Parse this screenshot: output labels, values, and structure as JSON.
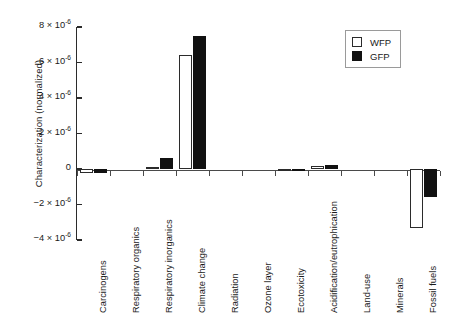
{
  "chart_data": {
    "type": "bar",
    "title": "",
    "xlabel": "",
    "ylabel": "Characterization (normalized)",
    "ylim": [
      -4e-06,
      8e-06
    ],
    "ytick_values": [
      8e-06,
      6e-06,
      4e-06,
      2e-06,
      0,
      -2e-06,
      -4e-06
    ],
    "ytick_labels": [
      "8 × 10",
      "6 × 10",
      "4 × 10",
      "2 × 10",
      "0",
      "−2 × 10",
      "−4 × 10"
    ],
    "ytick_exponents": [
      "-6",
      "-6",
      "-6",
      "-6",
      "",
      "-6",
      "-6"
    ],
    "grid": false,
    "legend_position": "top-right",
    "categories": [
      "Carcinogens",
      "Respiratory organics",
      "Respiratory inorganics",
      "Climate change",
      "Radiation",
      "Ozone layer",
      "Ecotoxicity",
      "Acidification/eutrophication",
      "Land-use",
      "Minerals",
      "Fossil fuels"
    ],
    "series": [
      {
        "name": "WFP",
        "color": "#ffffff",
        "edge_color": "#2b2b2b",
        "values": [
          -2.2e-07,
          0.0,
          4e-08,
          6.4e-06,
          0.0,
          0.0,
          -3e-08,
          1.6e-07,
          0.0,
          0.0,
          -3.3e-06
        ]
      },
      {
        "name": "GFP",
        "color": "#111111",
        "edge_color": "#111111",
        "values": [
          -2.4e-07,
          0.0,
          6e-07,
          7.5e-06,
          0.0,
          0.0,
          -2e-08,
          2.4e-07,
          0.0,
          0.0,
          -1.6e-06
        ]
      }
    ]
  },
  "legend": {
    "entries": [
      {
        "label": "WFP",
        "swatch": "open-square"
      },
      {
        "label": "GFP",
        "swatch": "filled-square"
      }
    ]
  }
}
